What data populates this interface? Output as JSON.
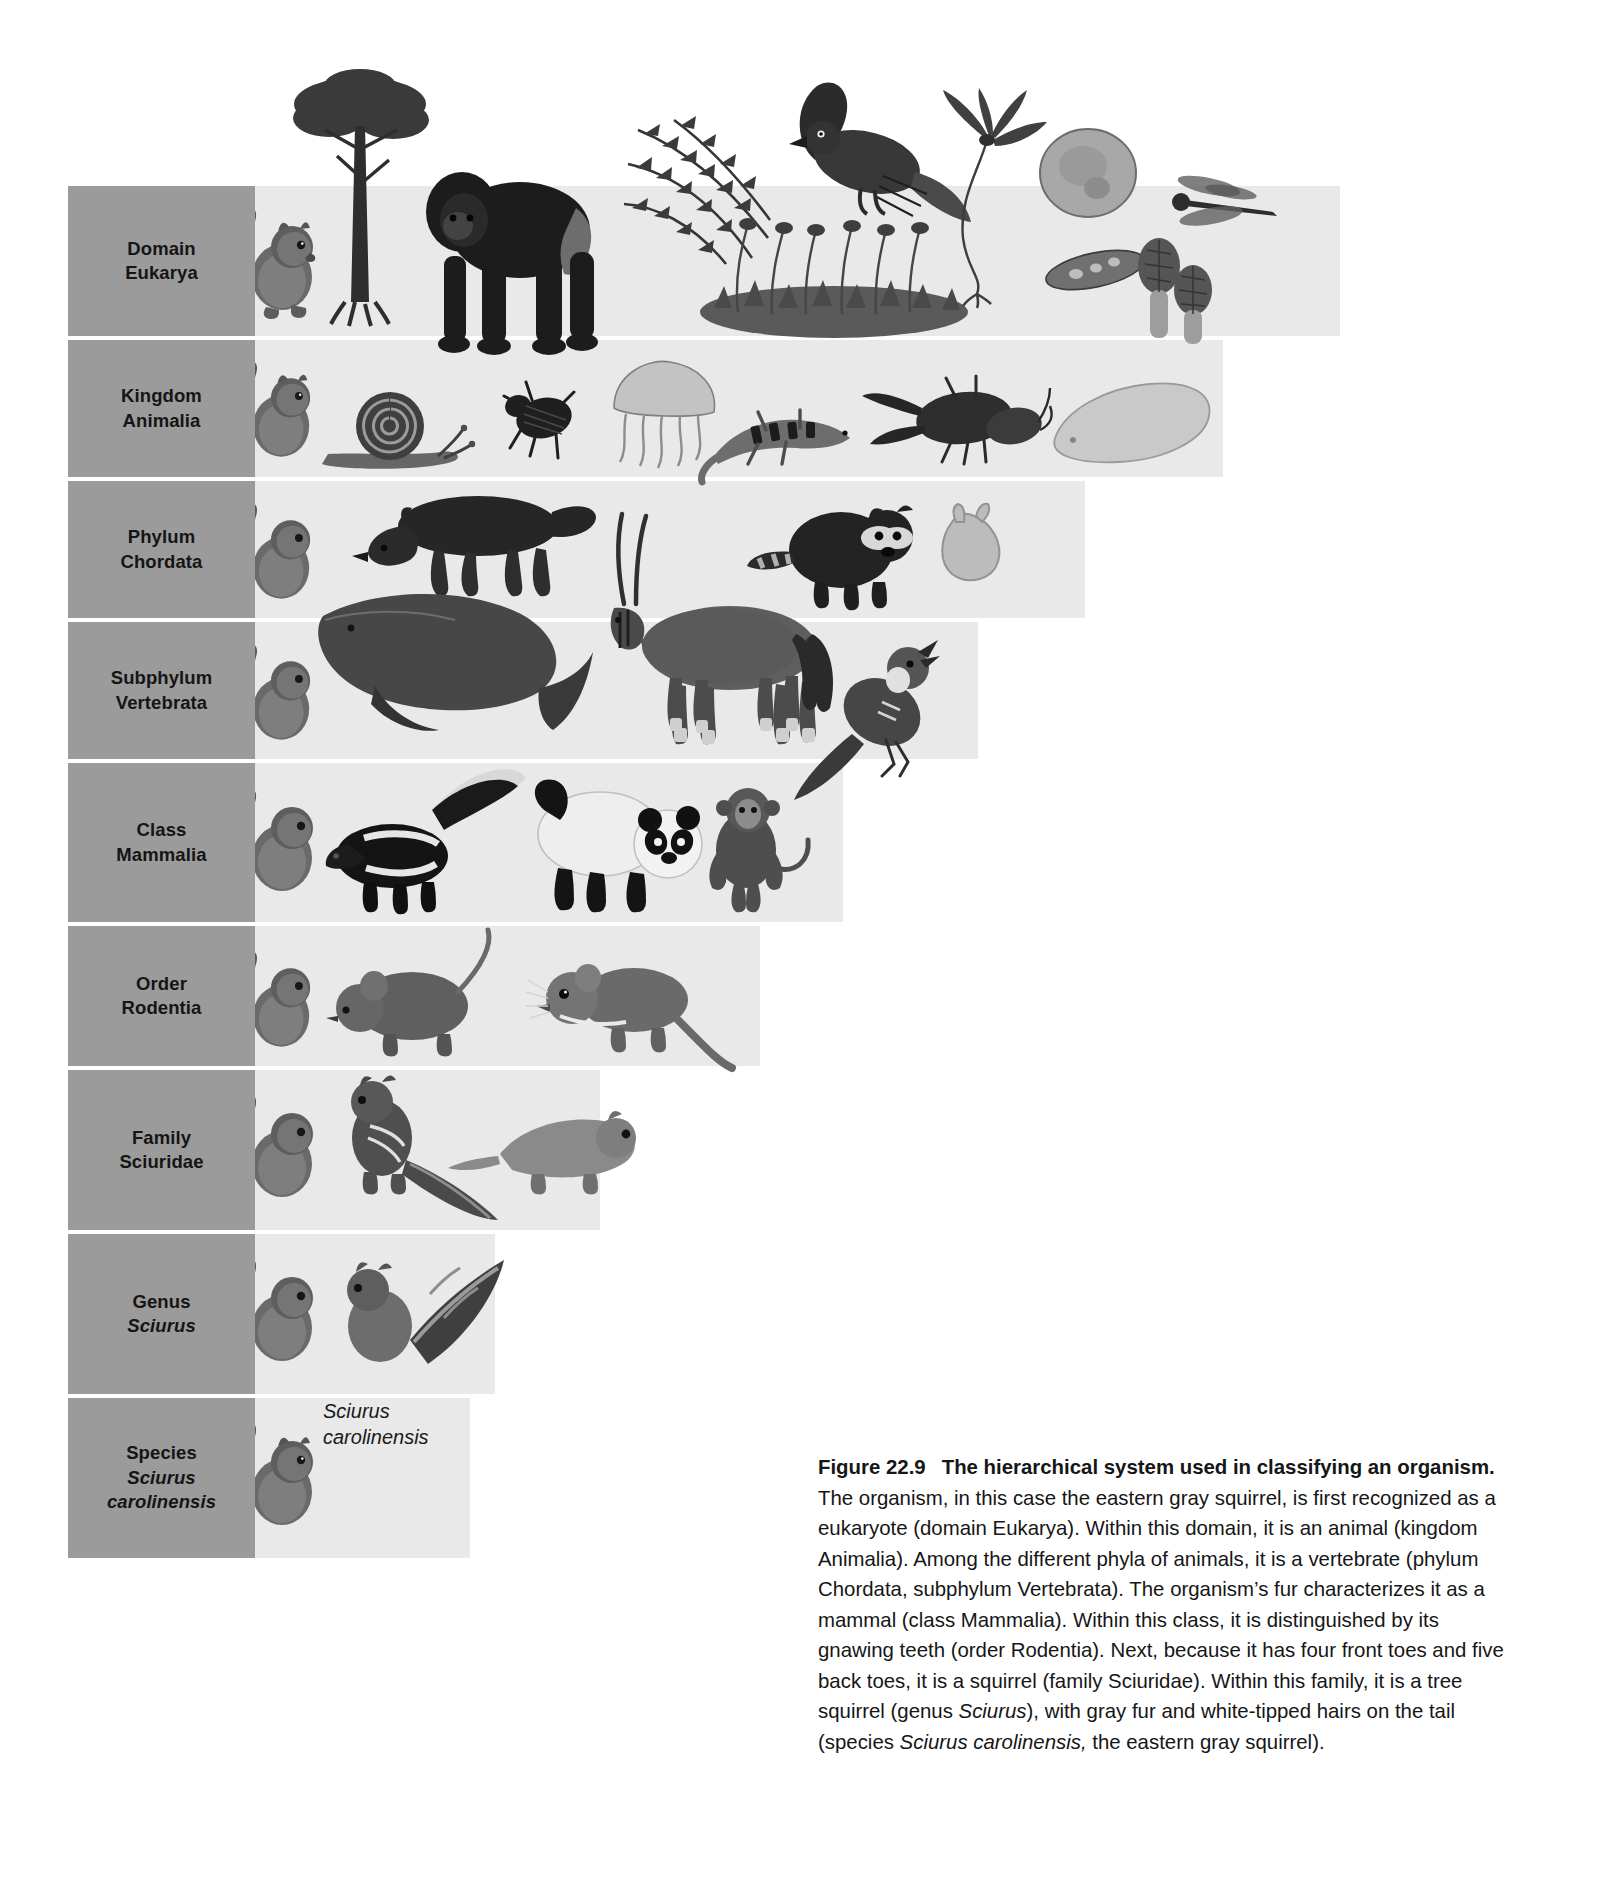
{
  "figure": {
    "number_label": "Figure 22.9",
    "title": "The hierarchical system used in classifying an organism.",
    "body_segments": [
      {
        "text": "The organism, in this case the eastern gray squirrel, is first recognized as a eukaryote (domain Eukarya). Within this domain, it is an animal (kingdom Animalia). Among the different phyla of animals, it is a vertebrate (phylum Chordata, subphylum Vertebrata). The organism’s fur characterizes it as a mammal (class Mammalia). Within this class, it is distinguished by its gnawing teeth (order Rodentia). Next, because it has four front toes and five back toes, it is a squirrel (family Sciuridae). Within this family, it is a tree squirrel (genus ",
        "italic": false
      },
      {
        "text": "Sciurus",
        "italic": true
      },
      {
        "text": "), with gray fur and white-tipped hairs on the tail (species ",
        "italic": false
      },
      {
        "text": "Sciurus carolinensis,",
        "italic": true
      },
      {
        "text": " the eastern gray squirrel).",
        "italic": false
      }
    ]
  },
  "colors": {
    "label_panel_gray": "#9b9b9b",
    "band_gray": "#e9e9e9",
    "page_background": "#ffffff",
    "text_black": "#151515"
  },
  "species_inline_label": "Sciurus\ncarolinensis",
  "ranks": [
    {
      "id": "domain",
      "rank": "Domain",
      "taxon": "Eukarya",
      "taxon_italic": false,
      "band_width": 1085,
      "organisms": [
        "eastern-gray-squirrel",
        "acacia-tree",
        "gorilla",
        "fern",
        "hawk",
        "moss-clump",
        "kelp",
        "amoeba",
        "paramecium",
        "dragonfly",
        "morel-mushrooms"
      ]
    },
    {
      "id": "kingdom",
      "rank": "Kingdom",
      "taxon": "Animalia",
      "taxon_italic": false,
      "band_width": 968,
      "organisms": [
        "eastern-gray-squirrel",
        "snail",
        "beetle",
        "jellyfish",
        "lizard",
        "crayfish",
        "flatworm"
      ]
    },
    {
      "id": "phylum",
      "rank": "Phylum",
      "taxon": "Chordata",
      "taxon_italic": false,
      "band_width": 830,
      "organisms": [
        "eastern-gray-squirrel",
        "fox",
        "oryx",
        "raccoon",
        "tunicate"
      ]
    },
    {
      "id": "subphylum",
      "rank": "Subphylum",
      "taxon": "Vertebrata",
      "taxon_italic": false,
      "band_width": 723,
      "organisms": [
        "eastern-gray-squirrel",
        "whale",
        "oryx",
        "songbird"
      ]
    },
    {
      "id": "class",
      "rank": "Class",
      "taxon": "Mammalia",
      "taxon_italic": false,
      "band_width": 588,
      "organisms": [
        "eastern-gray-squirrel",
        "skunk",
        "panda",
        "monkey"
      ]
    },
    {
      "id": "order",
      "rank": "Order",
      "taxon": "Rodentia",
      "taxon_italic": false,
      "band_width": 505,
      "organisms": [
        "eastern-gray-squirrel",
        "mouse",
        "kangaroo-rat"
      ]
    },
    {
      "id": "family",
      "rank": "Family",
      "taxon": "Sciuridae",
      "taxon_italic": false,
      "band_width": 345,
      "organisms": [
        "eastern-gray-squirrel",
        "chipmunk",
        "flying-squirrel"
      ]
    },
    {
      "id": "genus",
      "rank": "Genus",
      "taxon": "Sciurus",
      "taxon_italic": true,
      "band_width": 240,
      "organisms": [
        "eastern-gray-squirrel",
        "fox-squirrel"
      ]
    },
    {
      "id": "species",
      "rank": "Species",
      "taxon": "Sciurus carolinensis",
      "taxon_italic": true,
      "band_width": 215,
      "organisms": [
        "eastern-gray-squirrel"
      ]
    }
  ]
}
